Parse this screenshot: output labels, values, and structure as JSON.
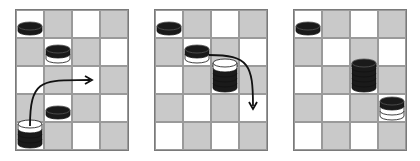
{
  "colors": {
    "light_square": "#ffffff",
    "dark_square": "#c9c9c9",
    "grid_line": "#9a9a9a",
    "piece_black": "#1a1a1a",
    "piece_white": "#ffffff",
    "arrow": "#111111"
  },
  "boards": [
    {
      "id": "board-1",
      "left": 15,
      "cols": 4,
      "rows": 5,
      "pieces": [
        {
          "row": 0,
          "col": 0,
          "layers": [
            "black"
          ]
        },
        {
          "row": 1,
          "col": 1,
          "layers": [
            "white",
            "black"
          ]
        },
        {
          "row": 3,
          "col": 1,
          "layers": [
            "black"
          ]
        },
        {
          "row": 4,
          "col": 0,
          "layers": [
            "black",
            "black",
            "black",
            "white"
          ]
        }
      ],
      "arrow": {
        "from": [
          4,
          0
        ],
        "to": [
          2,
          2
        ],
        "shape": "arc-up-right"
      }
    },
    {
      "id": "board-2",
      "left": 154,
      "cols": 4,
      "rows": 5,
      "pieces": [
        {
          "row": 0,
          "col": 0,
          "layers": [
            "black"
          ]
        },
        {
          "row": 1,
          "col": 1,
          "layers": [
            "white",
            "black"
          ]
        },
        {
          "row": 2,
          "col": 2,
          "layers": [
            "black",
            "black",
            "black",
            "black",
            "white"
          ]
        }
      ],
      "arrow": {
        "from": [
          1,
          1
        ],
        "to": [
          3,
          3
        ],
        "shape": "arc-right-down"
      }
    },
    {
      "id": "board-3",
      "left": 293,
      "cols": 4,
      "rows": 5,
      "pieces": [
        {
          "row": 0,
          "col": 0,
          "layers": [
            "black"
          ]
        },
        {
          "row": 2,
          "col": 2,
          "layers": [
            "black",
            "black",
            "black",
            "black",
            "black"
          ]
        },
        {
          "row": 3,
          "col": 3,
          "layers": [
            "white",
            "white",
            "black"
          ]
        }
      ],
      "arrow": null
    }
  ]
}
